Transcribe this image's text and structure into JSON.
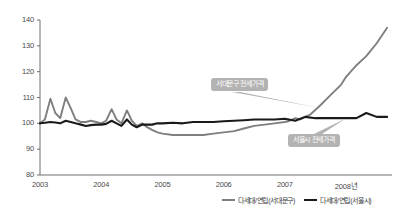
{
  "chart_data": {
    "type": "line",
    "title": "",
    "xlabel": "",
    "ylabel": "",
    "ylim": [
      80,
      140
    ],
    "xlim": [
      2003.0,
      2008.75
    ],
    "yticks": [
      80,
      90,
      100,
      110,
      120,
      130,
      140
    ],
    "xticks": [
      2003,
      2004,
      2005,
      2006,
      2007,
      2008
    ],
    "xtick_labels": [
      "2003",
      "2004",
      "2005",
      "2006",
      "2007",
      "2008년"
    ],
    "ytick_labels": [
      "80",
      "90",
      "100",
      "110",
      "120",
      "130",
      "140"
    ],
    "grid": false,
    "legend_position": "bottom-right",
    "series": [
      {
        "name": "다세대/연립(서대문구)",
        "color": "#7f7f7f",
        "x": [
          2003.0,
          2003.08,
          2003.17,
          2003.25,
          2003.33,
          2003.42,
          2003.5,
          2003.58,
          2003.67,
          2003.75,
          2003.83,
          2003.92,
          2004.0,
          2004.08,
          2004.17,
          2004.25,
          2004.33,
          2004.42,
          2004.5,
          2004.58,
          2004.67,
          2004.75,
          2004.83,
          2004.92,
          2005.0,
          2005.17,
          2005.33,
          2005.5,
          2005.67,
          2005.83,
          2006.0,
          2006.17,
          2006.33,
          2006.5,
          2006.67,
          2006.83,
          2007.0,
          2007.08,
          2007.17,
          2007.25,
          2007.42,
          2007.58,
          2007.75,
          2007.92,
          2008.0,
          2008.17,
          2008.33,
          2008.5,
          2008.67
        ],
        "values": [
          100.0,
          101.5,
          109.5,
          104.0,
          102.0,
          110.0,
          106.0,
          101.5,
          100.5,
          100.5,
          101.0,
          100.5,
          100.0,
          101.0,
          105.5,
          101.5,
          100.0,
          105.0,
          101.0,
          99.0,
          100.0,
          98.5,
          97.5,
          96.5,
          96.0,
          95.5,
          95.5,
          95.5,
          95.5,
          96.0,
          96.5,
          97.0,
          98.0,
          99.0,
          99.5,
          100.0,
          100.5,
          101.0,
          102.0,
          101.5,
          103.5,
          107.0,
          111.0,
          115.0,
          118.0,
          122.5,
          126.0,
          131.0,
          137.0
        ]
      },
      {
        "name": "다세대/연립(서울시)",
        "color": "#1a1a1a",
        "x": [
          2003.0,
          2003.08,
          2003.17,
          2003.25,
          2003.33,
          2003.42,
          2003.5,
          2003.58,
          2003.67,
          2003.75,
          2003.83,
          2003.92,
          2004.0,
          2004.08,
          2004.17,
          2004.25,
          2004.33,
          2004.42,
          2004.5,
          2004.58,
          2004.67,
          2004.75,
          2004.83,
          2004.92,
          2005.0,
          2005.17,
          2005.33,
          2005.5,
          2005.67,
          2005.83,
          2006.0,
          2006.17,
          2006.33,
          2006.5,
          2006.67,
          2006.83,
          2007.0,
          2007.17,
          2007.33,
          2007.5,
          2007.67,
          2007.83,
          2008.0,
          2008.17,
          2008.33,
          2008.5,
          2008.67
        ],
        "values": [
          100.0,
          100.2,
          100.5,
          100.3,
          100.0,
          101.0,
          100.5,
          100.0,
          99.5,
          99.0,
          99.3,
          99.5,
          99.5,
          99.8,
          101.0,
          100.0,
          99.0,
          101.5,
          99.5,
          98.5,
          99.5,
          99.5,
          99.5,
          100.0,
          100.0,
          100.2,
          100.0,
          100.5,
          100.5,
          100.5,
          100.8,
          101.0,
          101.2,
          101.5,
          101.5,
          101.5,
          101.8,
          101.0,
          102.5,
          102.0,
          102.0,
          102.0,
          102.0,
          102.0,
          104.0,
          102.5,
          102.5
        ]
      }
    ],
    "annotations": [
      {
        "text": "서대문구 전세가격",
        "target_x": 2007.55,
        "target_y": 106.0
      },
      {
        "text": "서울시 전세가격",
        "target_x": 2008.0,
        "target_y": 102.0
      }
    ]
  },
  "legend": {
    "items": [
      {
        "label": "다세대/연립(서대문구)",
        "color": "#7f7f7f"
      },
      {
        "label": "다세대/연립(서울시)",
        "color": "#1a1a1a"
      }
    ]
  }
}
